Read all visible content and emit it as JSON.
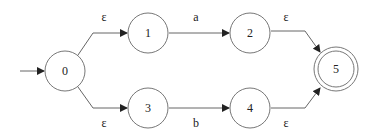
{
  "diagram": {
    "type": "NFA state diagram",
    "start_state": "0",
    "accept_states": [
      "5"
    ],
    "states": [
      {
        "id": "0",
        "label": "0",
        "x": 65,
        "y": 71
      },
      {
        "id": "1",
        "label": "1",
        "x": 148,
        "y": 33
      },
      {
        "id": "2",
        "label": "2",
        "x": 250,
        "y": 33
      },
      {
        "id": "3",
        "label": "3",
        "x": 148,
        "y": 108
      },
      {
        "id": "4",
        "label": "4",
        "x": 250,
        "y": 108
      },
      {
        "id": "5",
        "label": "5",
        "x": 336,
        "y": 69
      }
    ],
    "transitions": [
      {
        "from": "0",
        "to": "1",
        "label": "ε"
      },
      {
        "from": "0",
        "to": "3",
        "label": "ε"
      },
      {
        "from": "1",
        "to": "2",
        "label": "a"
      },
      {
        "from": "3",
        "to": "4",
        "label": "b"
      },
      {
        "from": "2",
        "to": "5",
        "label": "ε"
      },
      {
        "from": "4",
        "to": "5",
        "label": "ε"
      }
    ],
    "colors": {
      "stroke": "#555555",
      "text": "#222222",
      "background": "#ffffff"
    }
  }
}
